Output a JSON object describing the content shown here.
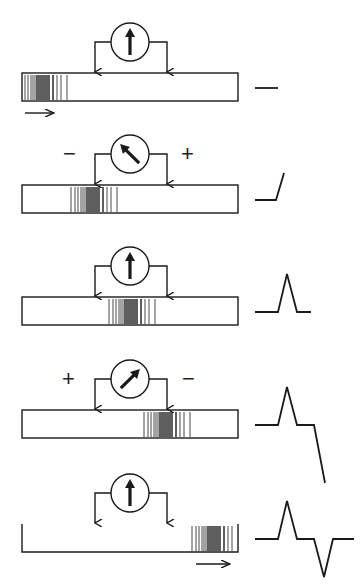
{
  "figure": {
    "panels": [
      {
        "id": 1,
        "meter_needle": "up",
        "left_sign": "",
        "right_sign": "",
        "depolarized_region": "left-end",
        "trace_stage": "flat",
        "propagation_arrow": "right-below-left"
      },
      {
        "id": 2,
        "meter_needle": "up-left",
        "left_sign": "−",
        "right_sign": "+",
        "depolarized_region": "under-left-electrode",
        "trace_stage": "rising"
      },
      {
        "id": 3,
        "meter_needle": "up",
        "left_sign": "",
        "right_sign": "",
        "depolarized_region": "between-electrodes",
        "trace_stage": "positive-peak"
      },
      {
        "id": 4,
        "meter_needle": "up-right",
        "left_sign": "+",
        "right_sign": "−",
        "depolarized_region": "under-right-electrode",
        "trace_stage": "falling"
      },
      {
        "id": 5,
        "meter_needle": "up",
        "left_sign": "",
        "right_sign": "",
        "depolarized_region": "right-end",
        "trace_stage": "biphasic-complete",
        "propagation_arrow": "right-below-right"
      }
    ],
    "caption_fragment": "(cut off)"
  },
  "colors": {
    "ink": "#1a1a1a",
    "background": "#ffffff"
  }
}
